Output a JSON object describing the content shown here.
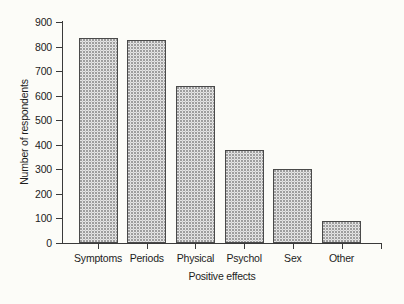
{
  "chart_data": {
    "type": "bar",
    "title": "",
    "xlabel": "Positive effects",
    "ylabel": "Number of respondents",
    "categories": [
      "Symptoms",
      "Periods",
      "Physical",
      "Psychol",
      "Sex",
      "Other"
    ],
    "values": [
      835,
      827,
      640,
      380,
      300,
      90
    ],
    "ylim": [
      0,
      900
    ],
    "yticks": [
      0,
      100,
      200,
      300,
      400,
      500,
      600,
      700,
      800,
      900
    ],
    "ytick_labels": [
      "0",
      "100",
      "200",
      "300",
      "400",
      "500",
      "600",
      "700",
      "800",
      "900"
    ],
    "grid": false,
    "legend": false,
    "series": [
      {
        "name": "Number of respondents",
        "values": [
          835,
          827,
          640,
          380,
          300,
          90
        ]
      }
    ],
    "colors": {
      "bar_fill": "#ffffff",
      "bar_pattern": "#9a9a9a",
      "bar_outline": "#4a4a4a",
      "axis": "#3a3a3a",
      "text": "#1d1d1d",
      "background": "#fcfcf8"
    }
  }
}
